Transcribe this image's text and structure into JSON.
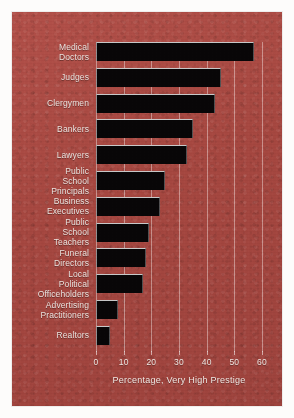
{
  "chart_data": {
    "type": "bar",
    "orientation": "horizontal",
    "title": "",
    "xlabel": "Percentage, Very High Prestige",
    "ylabel": "",
    "xlim": [
      0,
      60
    ],
    "xticks": [
      0,
      10,
      20,
      30,
      40,
      50,
      60
    ],
    "xtick_labels": [
      "0",
      "10",
      "20",
      "30",
      "40",
      "50",
      "60"
    ],
    "grid": "vertical",
    "legend": "none",
    "bar_color": "#080607",
    "background_color": "#a84942",
    "text_color": "#eae2de",
    "categories": [
      "Medical\nDoctors",
      "Judges",
      "Clergymen",
      "Bankers",
      "Lawyers",
      "Public School\nPrincipals",
      "Business\nExecutives",
      "Public School\nTeachers",
      "Funeral\nDirectors",
      "Local Political\nOfficeholders",
      "Advertising\nPractitioners",
      "Realtors"
    ],
    "values": [
      57,
      45,
      43,
      35,
      33,
      25,
      23,
      19,
      18,
      17,
      8,
      5
    ]
  }
}
